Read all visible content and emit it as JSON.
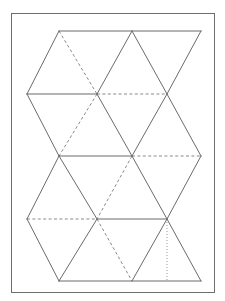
{
  "document": {
    "title": "Icosahedron net",
    "description": "Line diagram of a 20-triangle icosahedron net inside a thin rectangular frame",
    "canvas": {
      "width": 225,
      "height": 301
    },
    "background_color": "#ffffff"
  },
  "colors": {
    "frame_stroke": "#6e6e6e",
    "solid_edge": "#6b6b6b",
    "dashed_edge": "#8a8a8a",
    "dotted_edge": "#9a9a9a",
    "paper": "#ffffff"
  },
  "frame": {
    "x": 11.5,
    "y": 13.5,
    "width": 203,
    "height": 279
  },
  "geometry": {
    "column_x": [
      27,
      59,
      97,
      132,
      167,
      201
    ],
    "row_y": [
      31,
      94,
      156,
      219,
      281
    ],
    "triangle_count": 20
  },
  "chart_data": {
    "type": "diagram",
    "vertices": {
      "r0": [
        [
          59,
          31
        ],
        [
          132,
          31
        ],
        [
          201,
          31
        ]
      ],
      "r1": [
        [
          27,
          94
        ],
        [
          97,
          94
        ],
        [
          167,
          94
        ]
      ],
      "r2": [
        [
          59,
          156
        ],
        [
          132,
          156
        ],
        [
          201,
          156
        ]
      ],
      "r3": [
        [
          27,
          219
        ],
        [
          97,
          219
        ],
        [
          167,
          219
        ]
      ],
      "r4": [
        [
          59,
          281
        ],
        [
          132,
          281
        ],
        [
          201,
          281
        ]
      ]
    },
    "edges": [
      {
        "id": "top-band-horizontal",
        "style": "solid",
        "from": [
          59,
          31
        ],
        "to": [
          201,
          31
        ]
      },
      {
        "id": "row1-horizontal-solid",
        "style": "solid",
        "from": [
          27,
          94
        ],
        "to": [
          97,
          94
        ]
      },
      {
        "id": "row1-horizontal-dashed",
        "style": "dashed",
        "from": [
          97,
          94
        ],
        "to": [
          167,
          94
        ]
      },
      {
        "id": "row2-horizontal-solid",
        "style": "solid",
        "from": [
          59,
          156
        ],
        "to": [
          132,
          156
        ]
      },
      {
        "id": "row2-horizontal-dashed",
        "style": "dashed",
        "from": [
          132,
          156
        ],
        "to": [
          201,
          156
        ]
      },
      {
        "id": "row3-horizontal-dashed",
        "style": "dashed",
        "from": [
          27,
          219
        ],
        "to": [
          97,
          219
        ]
      },
      {
        "id": "row3-horizontal-solid",
        "style": "solid",
        "from": [
          97,
          219
        ],
        "to": [
          167,
          219
        ]
      },
      {
        "id": "bottom-band-horizontal",
        "style": "solid",
        "from": [
          59,
          281
        ],
        "to": [
          201,
          281
        ]
      },
      {
        "id": "d-a1",
        "style": "solid",
        "from": [
          59,
          31
        ],
        "to": [
          27,
          94
        ]
      },
      {
        "id": "d-a2",
        "style": "dashed",
        "from": [
          59,
          31
        ],
        "to": [
          97,
          94
        ]
      },
      {
        "id": "d-a3",
        "style": "solid",
        "from": [
          132,
          31
        ],
        "to": [
          97,
          94
        ]
      },
      {
        "id": "d-a4",
        "style": "solid",
        "from": [
          132,
          31
        ],
        "to": [
          167,
          94
        ]
      },
      {
        "id": "d-a5",
        "style": "solid",
        "from": [
          201,
          31
        ],
        "to": [
          167,
          94
        ]
      },
      {
        "id": "d-b1",
        "style": "solid",
        "from": [
          27,
          94
        ],
        "to": [
          59,
          156
        ]
      },
      {
        "id": "d-b2",
        "style": "dashed",
        "from": [
          97,
          94
        ],
        "to": [
          59,
          156
        ]
      },
      {
        "id": "d-b3",
        "style": "solid",
        "from": [
          97,
          94
        ],
        "to": [
          132,
          156
        ]
      },
      {
        "id": "d-b4",
        "style": "solid",
        "from": [
          167,
          94
        ],
        "to": [
          132,
          156
        ]
      },
      {
        "id": "d-b5",
        "style": "solid",
        "from": [
          167,
          94
        ],
        "to": [
          201,
          156
        ]
      },
      {
        "id": "d-c1",
        "style": "solid",
        "from": [
          59,
          156
        ],
        "to": [
          27,
          219
        ]
      },
      {
        "id": "d-c2",
        "style": "solid",
        "from": [
          59,
          156
        ],
        "to": [
          97,
          219
        ]
      },
      {
        "id": "d-c3",
        "style": "dashed",
        "from": [
          132,
          156
        ],
        "to": [
          97,
          219
        ]
      },
      {
        "id": "d-c4",
        "style": "solid",
        "from": [
          132,
          156
        ],
        "to": [
          167,
          219
        ]
      },
      {
        "id": "d-c5",
        "style": "solid",
        "from": [
          201,
          156
        ],
        "to": [
          167,
          219
        ]
      },
      {
        "id": "d-d1",
        "style": "solid",
        "from": [
          27,
          219
        ],
        "to": [
          59,
          281
        ]
      },
      {
        "id": "d-d2",
        "style": "dashed",
        "from": [
          97,
          219
        ],
        "to": [
          132,
          281
        ]
      },
      {
        "id": "d-d3",
        "style": "solid",
        "from": [
          97,
          219
        ],
        "to": [
          59,
          281
        ]
      },
      {
        "id": "d-d4",
        "style": "solid",
        "from": [
          167,
          219
        ],
        "to": [
          132,
          281
        ]
      },
      {
        "id": "d-d5",
        "style": "solid",
        "from": [
          167,
          219
        ],
        "to": [
          201,
          281
        ]
      },
      {
        "id": "fold-vertical-dotted",
        "style": "dotted",
        "from": [
          167,
          219
        ],
        "to": [
          167,
          281
        ]
      }
    ]
  }
}
